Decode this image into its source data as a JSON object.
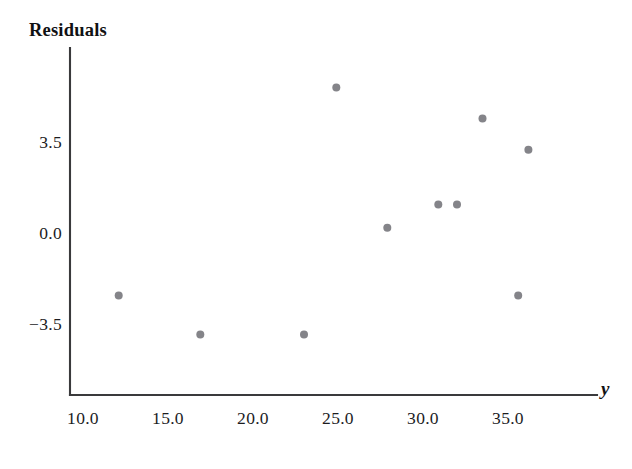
{
  "chart_data": {
    "type": "scatter",
    "title": "",
    "xlabel": "y",
    "ylabel": "Residuals",
    "xlim": [
      8.5,
      36.8
    ],
    "ylim": [
      -5.2,
      6.6
    ],
    "grid": false,
    "legend": null,
    "xticks": [
      "10.0",
      "15.0",
      "20.0",
      "25.0",
      "30.0",
      "35.0"
    ],
    "xtick_values": [
      10.0,
      15.0,
      20.0,
      25.0,
      30.0,
      35.0
    ],
    "yticks": [
      "3.5",
      "0.0",
      "−3.5"
    ],
    "ytick_values": [
      3.5,
      0.0,
      -3.5
    ],
    "marker": "circle",
    "marker_color": "#848489",
    "marker_size": 8,
    "points": [
      {
        "x": 12.1,
        "y": -2.4
      },
      {
        "x": 16.9,
        "y": -3.9
      },
      {
        "x": 23.0,
        "y": -3.9
      },
      {
        "x": 24.9,
        "y": 5.6
      },
      {
        "x": 27.9,
        "y": 0.2
      },
      {
        "x": 30.9,
        "y": 1.1
      },
      {
        "x": 32.0,
        "y": 1.1
      },
      {
        "x": 33.5,
        "y": 4.4
      },
      {
        "x": 36.2,
        "y": 3.2
      },
      {
        "x": 35.6,
        "y": -2.4
      }
    ]
  },
  "axes": {
    "y_axis_title": "Residuals",
    "x_axis_title": "y"
  }
}
